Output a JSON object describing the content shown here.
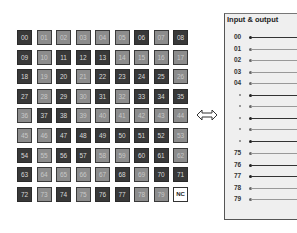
{
  "grid": {
    "cells": [
      {
        "label": "00",
        "shade": "D"
      },
      {
        "label": "01",
        "shade": "L"
      },
      {
        "label": "02",
        "shade": "L"
      },
      {
        "label": "03",
        "shade": "L"
      },
      {
        "label": "04",
        "shade": "L"
      },
      {
        "label": "05",
        "shade": "L"
      },
      {
        "label": "06",
        "shade": "D"
      },
      {
        "label": "07",
        "shade": "L"
      },
      {
        "label": "08",
        "shade": "D"
      },
      {
        "label": "09",
        "shade": "D"
      },
      {
        "label": "10",
        "shade": "L"
      },
      {
        "label": "11",
        "shade": "D"
      },
      {
        "label": "12",
        "shade": "D"
      },
      {
        "label": "13",
        "shade": "D"
      },
      {
        "label": "14",
        "shade": "L"
      },
      {
        "label": "15",
        "shade": "L"
      },
      {
        "label": "16",
        "shade": "L"
      },
      {
        "label": "17",
        "shade": "L"
      },
      {
        "label": "18",
        "shade": "D"
      },
      {
        "label": "19",
        "shade": "L"
      },
      {
        "label": "20",
        "shade": "D"
      },
      {
        "label": "21",
        "shade": "L"
      },
      {
        "label": "22",
        "shade": "D"
      },
      {
        "label": "23",
        "shade": "D"
      },
      {
        "label": "24",
        "shade": "D"
      },
      {
        "label": "25",
        "shade": "D"
      },
      {
        "label": "26",
        "shade": "L"
      },
      {
        "label": "27",
        "shade": "D"
      },
      {
        "label": "28",
        "shade": "L"
      },
      {
        "label": "29",
        "shade": "D"
      },
      {
        "label": "30",
        "shade": "L"
      },
      {
        "label": "31",
        "shade": "D"
      },
      {
        "label": "32",
        "shade": "L"
      },
      {
        "label": "33",
        "shade": "D"
      },
      {
        "label": "34",
        "shade": "D"
      },
      {
        "label": "35",
        "shade": "D"
      },
      {
        "label": "36",
        "shade": "L"
      },
      {
        "label": "37",
        "shade": "D"
      },
      {
        "label": "38",
        "shade": "D"
      },
      {
        "label": "39",
        "shade": "L"
      },
      {
        "label": "40",
        "shade": "L"
      },
      {
        "label": "41",
        "shade": "L"
      },
      {
        "label": "42",
        "shade": "L"
      },
      {
        "label": "43",
        "shade": "L"
      },
      {
        "label": "44",
        "shade": "L"
      },
      {
        "label": "45",
        "shade": "L"
      },
      {
        "label": "46",
        "shade": "L"
      },
      {
        "label": "47",
        "shade": "D"
      },
      {
        "label": "48",
        "shade": "D"
      },
      {
        "label": "49",
        "shade": "D"
      },
      {
        "label": "50",
        "shade": "D"
      },
      {
        "label": "51",
        "shade": "D"
      },
      {
        "label": "52",
        "shade": "D"
      },
      {
        "label": "53",
        "shade": "L"
      },
      {
        "label": "54",
        "shade": "D"
      },
      {
        "label": "55",
        "shade": "L"
      },
      {
        "label": "56",
        "shade": "D"
      },
      {
        "label": "57",
        "shade": "D"
      },
      {
        "label": "58",
        "shade": "L"
      },
      {
        "label": "59",
        "shade": "L"
      },
      {
        "label": "60",
        "shade": "D"
      },
      {
        "label": "61",
        "shade": "D"
      },
      {
        "label": "62",
        "shade": "L"
      },
      {
        "label": "63",
        "shade": "D"
      },
      {
        "label": "64",
        "shade": "L"
      },
      {
        "label": "65",
        "shade": "L"
      },
      {
        "label": "66",
        "shade": "L"
      },
      {
        "label": "67",
        "shade": "L"
      },
      {
        "label": "68",
        "shade": "D"
      },
      {
        "label": "69",
        "shade": "L"
      },
      {
        "label": "70",
        "shade": "D"
      },
      {
        "label": "71",
        "shade": "D"
      },
      {
        "label": "72",
        "shade": "D"
      },
      {
        "label": "73",
        "shade": "L"
      },
      {
        "label": "74",
        "shade": "D"
      },
      {
        "label": "75",
        "shade": "L"
      },
      {
        "label": "76",
        "shade": "D"
      },
      {
        "label": "77",
        "shade": "D"
      },
      {
        "label": "78",
        "shade": "L"
      },
      {
        "label": "79",
        "shade": "L"
      },
      {
        "label": "NC",
        "shade": "W"
      }
    ]
  },
  "arrow": {
    "icon": "double-arrow-icon"
  },
  "panel": {
    "title": "Input & output",
    "rows": [
      {
        "label": "00",
        "style": "dark",
        "y": 36
      },
      {
        "label": "01",
        "style": "light",
        "y": 48
      },
      {
        "label": "02",
        "style": "light",
        "y": 59
      },
      {
        "label": "03",
        "style": "light",
        "y": 71
      },
      {
        "label": "04",
        "style": "light",
        "y": 82
      },
      {
        "label": "",
        "style": "dark",
        "y": 94
      },
      {
        "label": "",
        "style": "light",
        "y": 105
      },
      {
        "label": "",
        "style": "dark",
        "y": 117
      },
      {
        "label": "",
        "style": "light",
        "y": 128
      },
      {
        "label": "",
        "style": "dark",
        "y": 140
      },
      {
        "label": "75",
        "style": "light",
        "y": 152
      },
      {
        "label": "76",
        "style": "dark",
        "y": 164
      },
      {
        "label": "77",
        "style": "dark",
        "y": 175
      },
      {
        "label": "78",
        "style": "light",
        "y": 187
      },
      {
        "label": "79",
        "style": "light",
        "y": 198
      }
    ]
  }
}
